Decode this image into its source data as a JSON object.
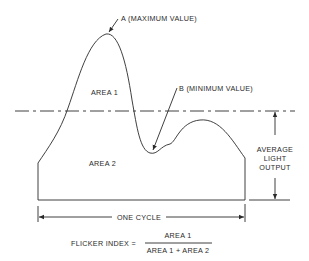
{
  "diagram": {
    "labels": {
      "max": "A (MAXIMUM VALUE)",
      "min": "B (MINIMUM VALUE)",
      "area1": "AREA 1",
      "area2": "AREA 2",
      "avg_line1": "AVERAGE",
      "avg_line2": "LIGHT",
      "avg_line3": "OUTPUT",
      "cycle": "ONE CYCLE"
    },
    "formula": {
      "lhs": "FLICKER INDEX =",
      "numerator": "AREA 1",
      "denominator": "AREA 1 + AREA 2"
    },
    "colors": {
      "ink": "#2a2a2a",
      "background": "#ffffff"
    }
  }
}
